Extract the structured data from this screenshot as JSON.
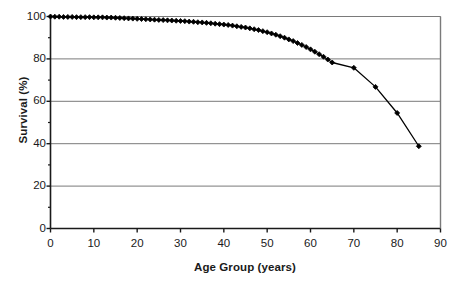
{
  "chart_data": {
    "type": "line",
    "title": "",
    "subtitle": "",
    "xlabel": "Age Group (years)",
    "ylabel": "Survival (%)",
    "xlim": [
      0,
      90
    ],
    "ylim": [
      0,
      100
    ],
    "xticks": [
      0,
      10,
      20,
      30,
      40,
      50,
      60,
      70,
      80,
      90
    ],
    "yticks": [
      0,
      20,
      40,
      60,
      80,
      100
    ],
    "xtick_labels": [
      "0",
      "10",
      "20",
      "30",
      "40",
      "50",
      "60",
      "70",
      "80",
      "90"
    ],
    "ytick_labels": [
      "0",
      "20",
      "40",
      "60",
      "80",
      "100"
    ],
    "grid": "horizontal",
    "legend": "none",
    "annotations": [],
    "series": [
      {
        "name": "Survival",
        "marker": "filled-diamond",
        "color": "#000000",
        "x": [
          0,
          1,
          2,
          3,
          4,
          5,
          6,
          7,
          8,
          9,
          10,
          11,
          12,
          13,
          14,
          15,
          16,
          17,
          18,
          19,
          20,
          21,
          22,
          23,
          24,
          25,
          26,
          27,
          28,
          29,
          30,
          31,
          32,
          33,
          34,
          35,
          36,
          37,
          38,
          39,
          40,
          41,
          42,
          43,
          44,
          45,
          46,
          47,
          48,
          49,
          50,
          51,
          52,
          53,
          54,
          55,
          56,
          57,
          58,
          59,
          60,
          61,
          62,
          63,
          64,
          65,
          70,
          75,
          80,
          85
        ],
        "y": [
          100,
          99.9,
          99.9,
          99.8,
          99.8,
          99.8,
          99.7,
          99.7,
          99.7,
          99.7,
          99.6,
          99.6,
          99.6,
          99.5,
          99.5,
          99.4,
          99.3,
          99.2,
          99.1,
          99.0,
          98.9,
          98.8,
          98.7,
          98.6,
          98.5,
          98.4,
          98.3,
          98.2,
          98.1,
          98.0,
          97.9,
          97.8,
          97.6,
          97.5,
          97.3,
          97.2,
          97.0,
          96.8,
          96.6,
          96.4,
          96.2,
          96.0,
          95.7,
          95.4,
          95.1,
          94.8,
          94.4,
          94.0,
          93.6,
          93.1,
          92.6,
          92.0,
          91.4,
          90.7,
          90.0,
          89.2,
          88.4,
          87.5,
          86.6,
          85.6,
          84.5,
          83.4,
          82.2,
          81.0,
          79.7,
          78.3,
          75.8,
          66.8,
          54.5,
          38.8
        ]
      }
    ]
  },
  "axes": {
    "y_axis_title": "Survival (%)",
    "x_axis_title": "Age Group (years)"
  },
  "colors": {
    "line": "#000000",
    "marker": "#000000",
    "grid": "#7a7a7a",
    "axis": "#1a1a1a",
    "background": "#ffffff"
  }
}
